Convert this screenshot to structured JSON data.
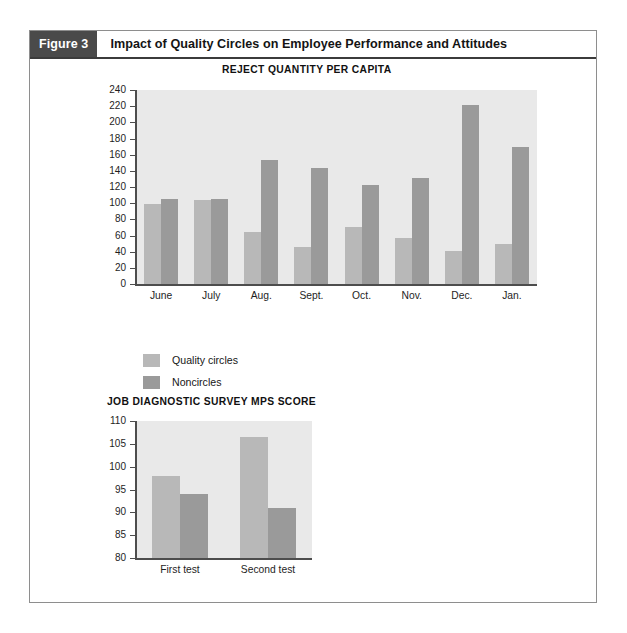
{
  "header": {
    "tag": "Figure 3",
    "title": "Impact of Quality Circles on Employee Performance and Attitudes"
  },
  "colors": {
    "quality_circles": "#b8b8b8",
    "noncircles": "#9a9a9a",
    "plot_background": "#e9e9e9",
    "axis": "#4d4d4d",
    "tag_background": "#4a4a4a",
    "header_rule": "#3b3b3b"
  },
  "legend": {
    "position": "below-upper-chart",
    "items": [
      {
        "label": "Quality circles",
        "color": "#b8b8b8"
      },
      {
        "label": "Noncircles",
        "color": "#9a9a9a"
      }
    ]
  },
  "chart_data": [
    {
      "type": "bar",
      "title": "REJECT QUANTITY PER CAPITA",
      "xlabel": "",
      "ylabel": "",
      "ylim": [
        0,
        240
      ],
      "ytick_step": 20,
      "yticks": [
        0,
        20,
        40,
        60,
        80,
        100,
        120,
        140,
        160,
        180,
        200,
        220,
        240
      ],
      "grid": false,
      "legend_position": "below-plot-left",
      "categories": [
        "June",
        "July",
        "Aug.",
        "Sept.",
        "Oct.",
        "Nov.",
        "Dec.",
        "Jan."
      ],
      "series": [
        {
          "name": "Quality circles",
          "color": "#b8b8b8",
          "values": [
            99,
            104,
            64,
            46,
            70,
            57,
            41,
            50
          ]
        },
        {
          "name": "Noncircles",
          "color": "#9a9a9a",
          "values": [
            105,
            105,
            154,
            144,
            122,
            131,
            221,
            170
          ]
        }
      ]
    },
    {
      "type": "bar",
      "title": "JOB DIAGNOSTIC SURVEY MPS SCORE",
      "xlabel": "",
      "ylabel": "",
      "ylim": [
        80,
        110
      ],
      "ytick_step": 5,
      "yticks": [
        80,
        85,
        90,
        95,
        100,
        105,
        110
      ],
      "grid": false,
      "legend_position": "shared-with-upper-chart",
      "categories": [
        "First test",
        "Second test"
      ],
      "series": [
        {
          "name": "Quality circles",
          "color": "#b8b8b8",
          "values": [
            98,
            106.5
          ]
        },
        {
          "name": "Noncircles",
          "color": "#9a9a9a",
          "values": [
            94,
            91
          ]
        }
      ]
    }
  ]
}
